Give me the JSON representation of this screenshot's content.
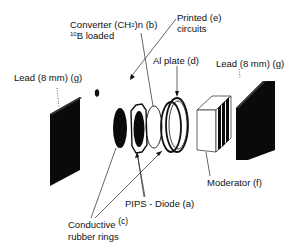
{
  "diagram": {
    "type": "exploded-assembly",
    "background": "#ffffff",
    "ink_color": "#111111",
    "labels": {
      "lead_left": "Lead (8 mm) (g)",
      "converter_line1_prefix": "Converter (CH",
      "converter_sub": "2",
      "converter_line1_suffix": ")n (b)",
      "converter_line2_sup": "10",
      "converter_line2": "B loaded",
      "printed_line1": "Printed  (e)",
      "printed_line2": "circuits",
      "al_plate": "Al plate (d)",
      "lead_right": "Lead (8 mm) (g)",
      "moderator": "Moderator (f)",
      "pips": "PIPS - Diode (a)",
      "conductive_line1": "Conductive",
      "conductive_suffix": "(c)",
      "conductive_line2": "rubber rings"
    },
    "components": [
      {
        "id": "a",
        "name": "PIPS - Diode"
      },
      {
        "id": "b",
        "name": "Converter (CH2)n 10B loaded"
      },
      {
        "id": "c",
        "name": "Conductive rubber rings"
      },
      {
        "id": "d",
        "name": "Al plate"
      },
      {
        "id": "e",
        "name": "Printed circuits"
      },
      {
        "id": "f",
        "name": "Moderator"
      },
      {
        "id": "g",
        "name": "Lead (8 mm)"
      }
    ]
  }
}
